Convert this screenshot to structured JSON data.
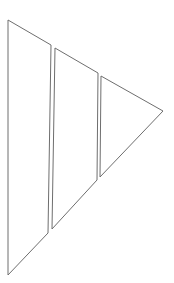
{
  "diagram": {
    "stroke_color": "#6e6e6e",
    "background": "#ffffff",
    "segments": [
      {
        "name": "left-segment",
        "points": "8,20 51,45 48,233 8,275"
      },
      {
        "name": "middle-segment",
        "points": "55,48 98,73 97,180 52,229"
      },
      {
        "name": "right-segment",
        "points": "101,76 163,111 100,177"
      }
    ]
  }
}
